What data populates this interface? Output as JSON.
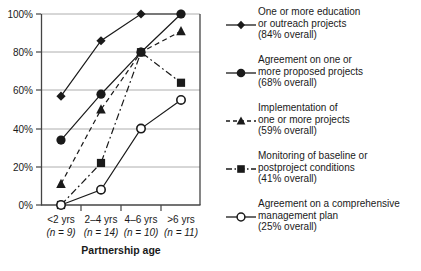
{
  "chart_data": {
    "type": "line",
    "title": "",
    "xlabel": "Partnership age",
    "ylabel": "",
    "ylim": [
      0,
      100
    ],
    "yticks": [
      "0%",
      "20%",
      "40%",
      "60%",
      "80%",
      "100%"
    ],
    "ytick_values": [
      0,
      20,
      40,
      60,
      80,
      100
    ],
    "grid": true,
    "legend_position": "right",
    "categories": [
      "<2 yrs",
      "2–4 yrs",
      "4–6 yrs",
      ">6 yrs"
    ],
    "category_counts": [
      "(n = 9)",
      "(n = 14)",
      "(n = 10)",
      "(n = 11)"
    ],
    "series": [
      {
        "name": "One or more education or outreach projects",
        "overall": "84% overall",
        "marker": "diamond",
        "line": "solid",
        "values": [
          57,
          86,
          100,
          100
        ]
      },
      {
        "name": "Agreement on one or more proposed projects",
        "overall": "68% overall",
        "marker": "circle-filled",
        "line": "solid",
        "values": [
          34,
          58,
          80,
          100
        ]
      },
      {
        "name": "Implementation of one or more projects",
        "overall": "59% overall",
        "marker": "triangle",
        "line": "dashed",
        "values": [
          11,
          50,
          80,
          91
        ]
      },
      {
        "name": "Monitoring of baseline or postproject conditions",
        "overall": "41% overall",
        "marker": "square",
        "line": "dash-dot",
        "values": [
          0,
          22,
          80,
          64
        ]
      },
      {
        "name": "Agreement on a comprehensive management plan",
        "overall": "25% overall",
        "marker": "circle-open",
        "line": "solid",
        "values": [
          0,
          8,
          40,
          55
        ]
      }
    ]
  },
  "axis": {
    "x_title": "Partnership age"
  },
  "legend": {
    "items": [
      {
        "key": "legend-key-education-outreach",
        "label": "One or more education\nor outreach projects\n(84% overall)"
      },
      {
        "key": "legend-key-agreement-proposed",
        "label": "Agreement on one or\nmore proposed projects\n(68% overall)"
      },
      {
        "key": "legend-key-implementation",
        "label": "Implementation of\none or more projects\n(59% overall)"
      },
      {
        "key": "legend-key-monitoring",
        "label": "Monitoring of baseline or\npostproject conditions\n(41% overall)"
      },
      {
        "key": "legend-key-management-plan",
        "label": "Agreement on a comprehensive\nmanagement plan\n(25% overall)"
      }
    ]
  },
  "colors": {
    "ink": "#1a1a1a",
    "grid": "#9a9a9a",
    "axis": "#555555",
    "background": "#ffffff"
  }
}
